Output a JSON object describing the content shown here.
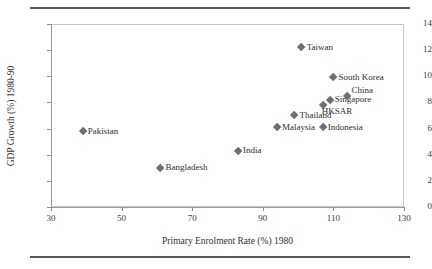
{
  "chart_data": {
    "type": "scatter",
    "title": "",
    "xlabel": "Primary Enrolment Rate (%) 1980",
    "ylabel": "GDP Growth (%) 1980-90",
    "xlim": [
      30,
      130
    ],
    "ylim": [
      0,
      14
    ],
    "xticks": [
      30,
      50,
      70,
      90,
      110,
      130
    ],
    "yticks": [
      0,
      2,
      4,
      6,
      8,
      10,
      12,
      14
    ],
    "grid": false,
    "legend": "none",
    "marker_shape": "diamond",
    "marker_color": "#6b6f77",
    "points": [
      {
        "label": "Pakistan",
        "x": 39,
        "y": 5.8,
        "label_pos": "right"
      },
      {
        "label": "Bangladesh",
        "x": 61,
        "y": 3.0,
        "label_pos": "right"
      },
      {
        "label": "India",
        "x": 83,
        "y": 4.3,
        "label_pos": "right"
      },
      {
        "label": "Malaysia",
        "x": 94,
        "y": 6.1,
        "label_pos": "right"
      },
      {
        "label": "Thailand",
        "x": 99,
        "y": 7.0,
        "label_pos": "right"
      },
      {
        "label": "Taiwan",
        "x": 101,
        "y": 12.2,
        "label_pos": "right"
      },
      {
        "label": "Indonesia",
        "x": 107,
        "y": 6.1,
        "label_pos": "right"
      },
      {
        "label": "HKSAR",
        "x": 107,
        "y": 7.8,
        "label_pos": "below"
      },
      {
        "label": "Singapore",
        "x": 109,
        "y": 8.2,
        "label_pos": "right"
      },
      {
        "label": "South Korea",
        "x": 110,
        "y": 9.9,
        "label_pos": "right"
      },
      {
        "label": "China",
        "x": 114,
        "y": 8.5,
        "label_pos": "above-right"
      }
    ]
  }
}
